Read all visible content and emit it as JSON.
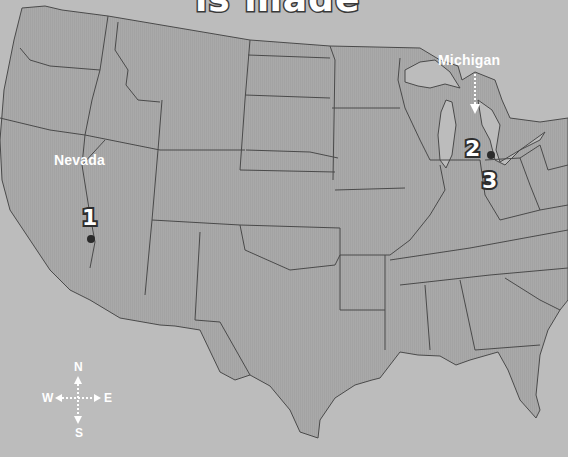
{
  "title_fragment": "is made",
  "colors": {
    "water": "#bcbcbc",
    "land": "#a8a8a8",
    "border": "#4a4a4a",
    "label": "#ffffff",
    "marker_outline": "#2e2e2e"
  },
  "labels": {
    "nevada": "Nevada",
    "michigan": "Michigan"
  },
  "markers": [
    {
      "number": "1",
      "state": "Nevada"
    },
    {
      "number": "2",
      "state": "Michigan"
    },
    {
      "number": "3",
      "state": "Michigan"
    }
  ],
  "compass": {
    "north": "N",
    "south": "S",
    "east": "E",
    "west": "W"
  }
}
